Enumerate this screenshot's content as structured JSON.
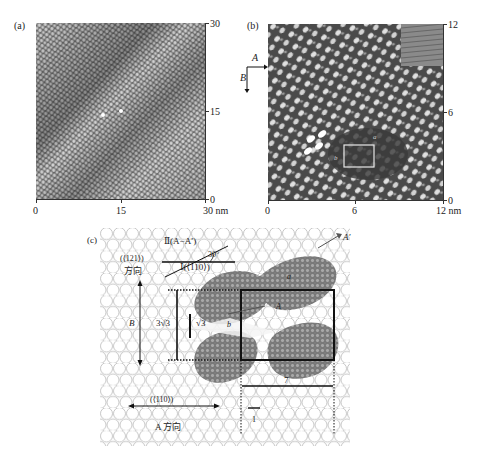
{
  "figure": {
    "panels": [
      {
        "id": "a",
        "label": "(a)",
        "type": "STM image",
        "x_ticks": [
          "0",
          "15",
          "30 nm"
        ],
        "y_ticks": [
          "30",
          "15",
          "0"
        ]
      },
      {
        "id": "b",
        "label": "(b)",
        "type": "STM image",
        "direction_labels": {
          "horizontal": "A",
          "vertical": "B"
        },
        "x_ticks": [
          "0",
          "6",
          "12 nm"
        ],
        "y_ticks": [
          "12",
          "6",
          "0"
        ],
        "overlay_labels": {
          "a": "a",
          "b": "b"
        }
      },
      {
        "id": "c",
        "label": "(c)",
        "type": "molecular model",
        "labels": {
          "dir_II": "Ⅱ(A−A′)",
          "dir_I": "Ⅰ(⟨110⟩)",
          "angle": "30°",
          "dir_121": "(⟨121⟩)",
          "dir_121_cn": "方向",
          "B": "B",
          "three_sqrt3": "3√3",
          "sqrt3": "√3",
          "a": "a",
          "b": "b",
          "A": "A",
          "A_prime": "A′",
          "seven": "7",
          "one": "1",
          "dir_110": "(⟨110⟩)",
          "dir_110_cn": "A 方向"
        }
      }
    ]
  },
  "colors": {
    "stm_a_base": "#8a8a8a",
    "stm_b_base": "#555555",
    "lattice_stroke": "#b8b8b8",
    "molecule": "#808080",
    "line": "#111111"
  }
}
